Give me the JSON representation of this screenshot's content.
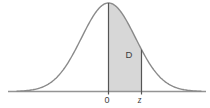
{
  "figure": {
    "name": "normal-distribution-shaded-area-figure",
    "labels": {
      "area": "D",
      "mean_tick": "0",
      "z_tick": "z"
    },
    "colors": {
      "background": "#ffffff",
      "curve": "#8a8a8a",
      "axis": "#949494",
      "boundary_lines": "#555555",
      "shaded_fill": "#d7d7d7",
      "text": "#3d3d3d"
    }
  },
  "chart_data": {
    "type": "area",
    "curve": "normal probability density (bell curve)",
    "x_tick_labels": [
      "0",
      "z"
    ],
    "shaded_region": {
      "from_tick": "0",
      "to_tick": "z",
      "label": "D"
    },
    "geometry_px": {
      "width": 210,
      "height": 108,
      "baseline_y": 91.5,
      "peak_y": 3,
      "mean_x": 108.5,
      "z_x": 141.5,
      "sigma": 27,
      "axis_x_start": 8,
      "axis_x_end": 206,
      "curve_x_start": 17,
      "curve_x_end": 201,
      "tick_below_axis": 3
    }
  }
}
